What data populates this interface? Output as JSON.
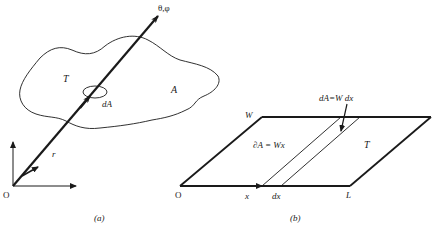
{
  "panel_a": {
    "caption": "(a)",
    "origin_label": "O",
    "direction_label": "θ,φ",
    "surface_label": "T",
    "area_label": "A",
    "element_label": "dA",
    "radius_label": "r"
  },
  "panel_b": {
    "caption": "(b)",
    "origin_label": "O",
    "width_label": "W",
    "length_label": "L",
    "surface_label": "T",
    "x_label": "x",
    "dx_label": "dx",
    "strip_area_label": "dA=W dx",
    "partial_area_label": "∂A = Wx"
  },
  "colors": {
    "ink": "#1a1a1a",
    "background": "#ffffff"
  }
}
